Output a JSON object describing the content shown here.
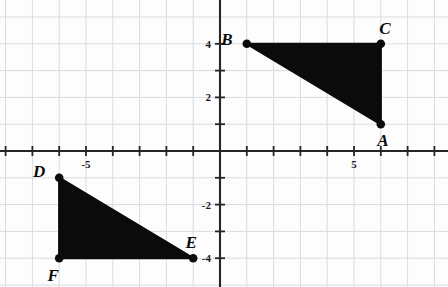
{
  "figure": {
    "title": "",
    "background_color": "#fdfdfd",
    "grid_color": "#d7dce3",
    "axis_color": "#262626",
    "shape_fill": "#0b0b0b",
    "label_color": "#0b0b0b"
  },
  "chart_data": {
    "type": "scatter",
    "title": "",
    "xlabel": "",
    "ylabel": "",
    "xlim": [
      -8.2,
      8.5
    ],
    "ylim": [
      -5.1,
      5.1
    ],
    "grid": true,
    "grid_step": 1,
    "legend": "none",
    "x_tick_labels": [
      {
        "value": -5,
        "text": "-5"
      },
      {
        "value": 5,
        "text": "5"
      }
    ],
    "y_tick_labels": [
      {
        "value": 4,
        "text": "4"
      },
      {
        "value": 2,
        "text": "2"
      },
      {
        "value": -2,
        "text": "-2"
      },
      {
        "value": -4,
        "text": "-4"
      }
    ],
    "x_ticks": [
      -8,
      -7,
      -6,
      -5,
      -4,
      -3,
      -2,
      -1,
      1,
      2,
      3,
      4,
      5,
      6,
      7,
      8
    ],
    "y_ticks": [
      -4,
      -3,
      -2,
      -1,
      1,
      2,
      3,
      4
    ],
    "series": [
      {
        "name": "triangle-abc",
        "type": "polygon",
        "points": [
          {
            "label": "B",
            "x": 1,
            "y": 4
          },
          {
            "label": "C",
            "x": 6,
            "y": 4
          },
          {
            "label": "A",
            "x": 6,
            "y": 1
          }
        ]
      },
      {
        "name": "triangle-def",
        "type": "polygon",
        "points": [
          {
            "label": "D",
            "x": -6,
            "y": -1
          },
          {
            "label": "E",
            "x": -1,
            "y": -4
          },
          {
            "label": "F",
            "x": -6,
            "y": -4
          }
        ]
      }
    ],
    "point_labels": [
      {
        "text": "A",
        "x": 6,
        "y": 1,
        "dx": 2,
        "dy": 22
      },
      {
        "text": "B",
        "x": 1,
        "y": 4,
        "dx": -20,
        "dy": 1
      },
      {
        "text": "C",
        "x": 6,
        "y": 4,
        "dx": 4,
        "dy": -10
      },
      {
        "text": "D",
        "x": -6,
        "y": -1,
        "dx": -20,
        "dy": -1
      },
      {
        "text": "E",
        "x": -1,
        "y": -4,
        "dx": -2,
        "dy": -10
      },
      {
        "text": "F",
        "x": -6,
        "y": -4,
        "dx": -6,
        "dy": 23
      }
    ]
  }
}
